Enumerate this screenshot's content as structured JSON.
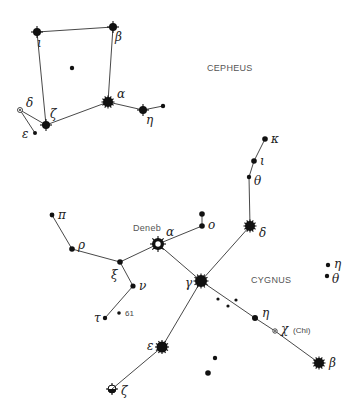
{
  "constellations": [
    {
      "name": "CEPHEUS",
      "label_pos": [
        207,
        71
      ],
      "stars": [
        {
          "id": "iota",
          "label": "ι",
          "x": 37,
          "y": 32,
          "r": 4,
          "type": "star4",
          "lx": 37,
          "ly": 47
        },
        {
          "id": "beta",
          "label": "β",
          "x": 113,
          "y": 27,
          "r": 4,
          "type": "star4",
          "lx": 115,
          "ly": 41
        },
        {
          "id": "center",
          "label": "",
          "x": 72,
          "y": 68,
          "r": 2.2,
          "type": "dot"
        },
        {
          "id": "alpha",
          "label": "α",
          "x": 108,
          "y": 102,
          "r": 5,
          "type": "burst",
          "lx": 117,
          "ly": 98
        },
        {
          "id": "eta",
          "label": "η",
          "x": 143,
          "y": 110,
          "r": 4,
          "type": "star4",
          "lx": 146,
          "ly": 124
        },
        {
          "id": "eta2",
          "label": "",
          "x": 163,
          "y": 106,
          "r": 2.2,
          "type": "dot"
        },
        {
          "id": "zeta",
          "label": "ζ",
          "x": 46,
          "y": 125,
          "r": 4,
          "type": "star4",
          "lx": 50,
          "ly": 118
        },
        {
          "id": "delta",
          "label": "δ",
          "x": 20,
          "y": 110,
          "r": 2.5,
          "type": "ring",
          "lx": 26,
          "ly": 107
        },
        {
          "id": "epsilon",
          "label": "ε",
          "x": 35,
          "y": 133,
          "r": 2,
          "type": "dot",
          "lx": 22,
          "ly": 138
        }
      ],
      "lines": [
        [
          "iota",
          "beta"
        ],
        [
          "beta",
          "alpha"
        ],
        [
          "iota",
          "zeta"
        ],
        [
          "zeta",
          "alpha"
        ],
        [
          "alpha",
          "eta"
        ],
        [
          "eta",
          "eta2"
        ],
        [
          "delta",
          "zeta"
        ],
        [
          "delta",
          "epsilon"
        ]
      ]
    },
    {
      "name": "CYGNUS",
      "label_pos": [
        251,
        283
      ],
      "stars": [
        {
          "id": "kappa",
          "label": "κ",
          "x": 265,
          "y": 139,
          "r": 2.8,
          "type": "dot",
          "lx": 271,
          "ly": 143
        },
        {
          "id": "iota",
          "label": "ι",
          "x": 254,
          "y": 161,
          "r": 2.8,
          "type": "dot",
          "lx": 260,
          "ly": 165
        },
        {
          "id": "theta",
          "label": "θ",
          "x": 249,
          "y": 177,
          "r": 2.2,
          "type": "dot",
          "lx": 254,
          "ly": 185
        },
        {
          "id": "delta",
          "label": "δ",
          "x": 250,
          "y": 226,
          "r": 5,
          "type": "burst",
          "lx": 259,
          "ly": 237
        },
        {
          "id": "o_top",
          "label": "",
          "x": 202,
          "y": 214,
          "r": 2.8,
          "type": "dot"
        },
        {
          "id": "omicron",
          "label": "ο",
          "x": 202,
          "y": 226,
          "r": 2.8,
          "type": "dot",
          "lx": 208,
          "ly": 229
        },
        {
          "id": "deneb",
          "label": "α",
          "x": 158,
          "y": 244,
          "r": 6,
          "type": "deneb",
          "lx": 166,
          "ly": 236
        },
        {
          "id": "pi",
          "label": "π",
          "x": 52,
          "y": 215,
          "r": 2.4,
          "type": "dot",
          "lx": 58,
          "ly": 219
        },
        {
          "id": "rho",
          "label": "ρ",
          "x": 72,
          "y": 249,
          "r": 2.8,
          "type": "dot",
          "lx": 78,
          "ly": 249
        },
        {
          "id": "xi",
          "label": "ξ",
          "x": 120,
          "y": 262,
          "r": 2.8,
          "type": "dot",
          "lx": 111,
          "ly": 279
        },
        {
          "id": "nu",
          "label": "ν",
          "x": 133,
          "y": 286,
          "r": 2.6,
          "type": "dot",
          "lx": 139,
          "ly": 290
        },
        {
          "id": "tau",
          "label": "τ",
          "x": 105,
          "y": 318,
          "r": 2.2,
          "type": "dot",
          "lx": 94,
          "ly": 322
        },
        {
          "id": "s61",
          "label": "61",
          "x": 119,
          "y": 313,
          "r": 1.8,
          "type": "dot",
          "lx": 125,
          "ly": 316
        },
        {
          "id": "gamma",
          "label": "γ",
          "x": 201,
          "y": 281,
          "r": 6,
          "type": "burst",
          "lx": 185,
          "ly": 287
        },
        {
          "id": "d1",
          "label": "",
          "x": 218,
          "y": 299,
          "r": 1.6,
          "type": "dot"
        },
        {
          "id": "d2",
          "label": "",
          "x": 228,
          "y": 306,
          "r": 1.6,
          "type": "dot"
        },
        {
          "id": "d3",
          "label": "",
          "x": 236,
          "y": 300,
          "r": 1.6,
          "type": "dot"
        },
        {
          "id": "eta",
          "label": "η",
          "x": 255,
          "y": 318,
          "r": 3,
          "type": "dot",
          "lx": 262,
          "ly": 317
        },
        {
          "id": "chi",
          "label": "χ",
          "x": 275,
          "y": 331,
          "r": 2.2,
          "type": "ring",
          "lx": 281,
          "ly": 333,
          "note": "(Chi)",
          "nx": 293,
          "ny": 333
        },
        {
          "id": "beta",
          "label": "β",
          "x": 319,
          "y": 363,
          "r": 5,
          "type": "burst",
          "lx": 329,
          "ly": 367
        },
        {
          "id": "epsilon",
          "label": "ε",
          "x": 162,
          "y": 347,
          "r": 5.5,
          "type": "burst",
          "lx": 147,
          "ly": 350
        },
        {
          "id": "zeta",
          "label": "ζ",
          "x": 112,
          "y": 389,
          "r": 4,
          "type": "zeta",
          "lx": 121,
          "ly": 395
        },
        {
          "id": "f1",
          "label": "",
          "x": 215,
          "y": 358,
          "r": 2.2,
          "type": "dot"
        },
        {
          "id": "f2",
          "label": "",
          "x": 208,
          "y": 373,
          "r": 2.8,
          "type": "dot"
        },
        {
          "id": "eta_r",
          "label": "η",
          "x": 328,
          "y": 265,
          "r": 2.2,
          "type": "dot",
          "lx": 334,
          "ly": 268
        },
        {
          "id": "theta_r",
          "label": "θ",
          "x": 327,
          "y": 276,
          "r": 2.2,
          "type": "dot",
          "lx": 332,
          "ly": 283
        }
      ],
      "lines": [
        [
          "kappa",
          "iota"
        ],
        [
          "iota",
          "theta"
        ],
        [
          "theta",
          "delta"
        ],
        [
          "delta",
          "gamma"
        ],
        [
          "o_top",
          "omicron"
        ],
        [
          "omicron",
          "deneb"
        ],
        [
          "deneb",
          "gamma"
        ],
        [
          "deneb",
          "xi"
        ],
        [
          "pi",
          "rho"
        ],
        [
          "rho",
          "xi"
        ],
        [
          "xi",
          "nu"
        ],
        [
          "nu",
          "tau"
        ],
        [
          "gamma",
          "eta"
        ],
        [
          "eta",
          "chi"
        ],
        [
          "chi",
          "beta"
        ],
        [
          "gamma",
          "epsilon"
        ],
        [
          "epsilon",
          "zeta"
        ]
      ],
      "extra_labels": [
        {
          "text": "Deneb",
          "x": 133,
          "y": 231
        }
      ]
    }
  ]
}
